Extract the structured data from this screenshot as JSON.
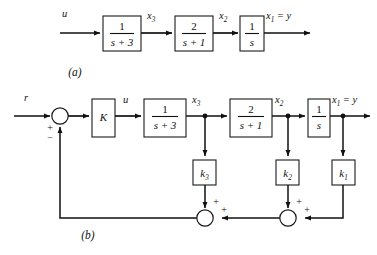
{
  "figure": {
    "captions": {
      "a": "(a)",
      "b": "(b)"
    }
  },
  "diagram_a": {
    "caption": "(a)",
    "input_label": "u",
    "blocks": [
      {
        "name": "block-1-over-s-plus-3",
        "numerator": "1",
        "denominator": "s + 3"
      },
      {
        "name": "block-2-over-s-plus-1",
        "numerator": "2",
        "denominator": "s + 1"
      },
      {
        "name": "block-1-over-s",
        "numerator": "1",
        "denominator": "s"
      }
    ],
    "signals": [
      {
        "name": "x3",
        "base": "x",
        "sub": "3"
      },
      {
        "name": "x2",
        "base": "x",
        "sub": "2"
      },
      {
        "name": "x1",
        "base": "x",
        "sub": "1",
        "equals": "= y"
      }
    ],
    "output_label": "y"
  },
  "diagram_b": {
    "caption": "(b)",
    "reference_label": "r",
    "control_label": "u",
    "summing_junction": {
      "name": "input-summing-junction",
      "sign_reference": "+",
      "sign_feedback": "−"
    },
    "gain_block": {
      "name": "block-K",
      "label": "K"
    },
    "blocks": [
      {
        "name": "block-1-over-s-plus-3",
        "numerator": "1",
        "denominator": "s + 3"
      },
      {
        "name": "block-2-over-s-plus-1",
        "numerator": "2",
        "denominator": "s + 1"
      },
      {
        "name": "block-1-over-s",
        "numerator": "1",
        "denominator": "s"
      }
    ],
    "signals": [
      {
        "name": "x3",
        "base": "x",
        "sub": "3"
      },
      {
        "name": "x2",
        "base": "x",
        "sub": "2"
      },
      {
        "name": "x1",
        "base": "x",
        "sub": "1",
        "equals": "= y"
      }
    ],
    "feedback_gains": [
      {
        "name": "block-k3",
        "base": "k",
        "sub": "3"
      },
      {
        "name": "block-k2",
        "base": "k",
        "sub": "2"
      },
      {
        "name": "block-k1",
        "base": "k",
        "sub": "1"
      }
    ],
    "feedback_summing_junctions": [
      {
        "name": "feedback-sum-left",
        "sign_top": "+",
        "sign_right": "+"
      },
      {
        "name": "feedback-sum-right",
        "sign_top": "+",
        "sign_right": "+"
      }
    ],
    "output_label": "y"
  },
  "colors": {
    "line": "#111111",
    "block_stroke": "#1a1a1a",
    "background": "#ffffff"
  }
}
